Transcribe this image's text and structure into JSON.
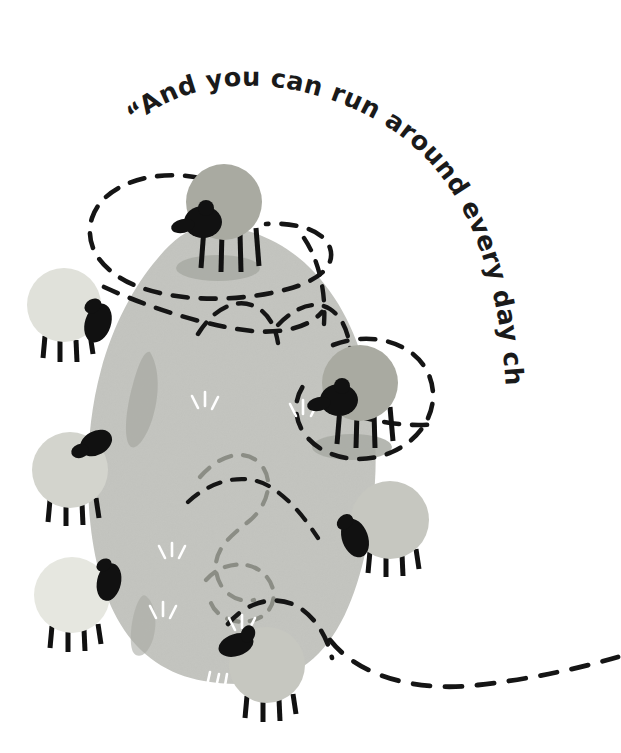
{
  "page": {
    "width": 621,
    "height": 753,
    "background_color": "#ffffff"
  },
  "quote": {
    "full_text": "“And you can run around every day chasing sheep.”",
    "segment_1": "“And you can run around",
    "segment_2": "every day chasing sheep.”",
    "color": "#1a1a1a",
    "style": "hand-lettered bold condensed, curved along an arc"
  },
  "colors": {
    "background": "#ffffff",
    "hill": "#c3c4bf",
    "hill_shadow": "#a8aaa3",
    "sheep_light": "#d9dad3",
    "sheep_pale": "#e3e4dd",
    "sheep_mid": "#c9cac3",
    "sheep_dark": "#a9aaa1",
    "sheep_darkest": "#9fa199",
    "sheep_head": "#111111",
    "sheep_leg": "#111111",
    "path_dash": "#151515",
    "path_dash_muted": "#8b8d85",
    "grass_tuft": "#ffffff"
  },
  "scene": {
    "hill": {
      "name": "meadow-hill",
      "description": "large organic blob-shaped grey-green meadow occupying the centre of the frame",
      "fill": "#c3c4bf",
      "bounds": {
        "x": 85,
        "y": 225,
        "width": 290,
        "height": 455
      }
    },
    "sheep": [
      {
        "id": "sheep-top-center",
        "label": "Sheep on hilltop",
        "cx": 224,
        "cy": 202,
        "r": 38,
        "body_fill": "#a9aaa1",
        "head_side": "left",
        "head_cx": 196,
        "head_cy": 223,
        "has_shadow": true
      },
      {
        "id": "sheep-upper-left",
        "label": "Sheep upper left",
        "cx": 64,
        "cy": 305,
        "r": 37,
        "body_fill": "#e0e1da",
        "head_side": "right",
        "head_cx": 97,
        "head_cy": 322,
        "has_shadow": false
      },
      {
        "id": "sheep-mid-left",
        "label": "Sheep middle left",
        "cx": 70,
        "cy": 470,
        "r": 38,
        "body_fill": "#d3d4cd",
        "head_side": "top-right",
        "head_cx": 96,
        "head_cy": 443,
        "has_shadow": false
      },
      {
        "id": "sheep-lower-left",
        "label": "Sheep lower left",
        "cx": 72,
        "cy": 595,
        "r": 38,
        "body_fill": "#e6e7e0",
        "head_side": "right",
        "head_cx": 108,
        "head_cy": 578,
        "has_shadow": false
      },
      {
        "id": "sheep-bottom-center",
        "label": "Sheep at the bottom",
        "cx": 267,
        "cy": 665,
        "r": 38,
        "body_fill": "#c6c7c0",
        "head_side": "upper-left",
        "head_cx": 235,
        "head_cy": 643,
        "has_shadow": false
      },
      {
        "id": "sheep-mid-right",
        "label": "Sheep middle right",
        "cx": 360,
        "cy": 383,
        "r": 38,
        "body_fill": "#a9aaa1",
        "head_side": "left",
        "head_cx": 333,
        "head_cy": 400,
        "has_shadow": true
      },
      {
        "id": "sheep-right",
        "label": "Sheep on the right",
        "cx": 390,
        "cy": 520,
        "r": 39,
        "body_fill": "#c6c7c0",
        "head_side": "lower-left",
        "head_cx": 353,
        "head_cy": 537,
        "has_shadow": false
      }
    ],
    "paths": [
      {
        "id": "path-upper-loop",
        "label": "Dashed running loop over the hilltop",
        "style": "dashed",
        "color": "#151515"
      },
      {
        "id": "path-right-loop",
        "label": "Dashed loop around the right sheep",
        "style": "dashed",
        "color": "#151515"
      },
      {
        "id": "path-hill-wander",
        "label": "Muted dashed wandering path across the meadow",
        "style": "dashed",
        "color": "#8b8d85"
      },
      {
        "id": "path-exit-right",
        "label": "Dashed path running off the right edge",
        "style": "dashed",
        "color": "#151515"
      }
    ],
    "grass_tufts": {
      "label": "small white grass strokes scattered on the meadow",
      "color": "#ffffff",
      "count": 9
    }
  }
}
